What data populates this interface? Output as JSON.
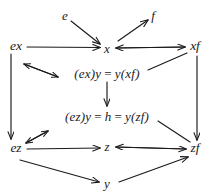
{
  "figure": {
    "kind": "commutative-diagram",
    "stroke_color": "#1a1a1a",
    "background_color": "#ffffff"
  },
  "nodes": [
    {
      "id": "e",
      "label": "e",
      "x": 65,
      "y": 15
    },
    {
      "id": "f",
      "label": "f",
      "x": 153,
      "y": 15
    },
    {
      "id": "ex",
      "label": "ex",
      "x": 16,
      "y": 46
    },
    {
      "id": "x",
      "label": "x",
      "x": 107,
      "y": 48
    },
    {
      "id": "xf",
      "label": "xf",
      "x": 194,
      "y": 46
    },
    {
      "id": "ez",
      "label": "ez",
      "x": 16,
      "y": 148
    },
    {
      "id": "z",
      "label": "z",
      "x": 107,
      "y": 146
    },
    {
      "id": "zf",
      "label": "zf",
      "x": 194,
      "y": 148
    },
    {
      "id": "y",
      "label": "y",
      "x": 107,
      "y": 183
    }
  ],
  "equations": [
    {
      "id": "upper-equation",
      "x": 107,
      "y": 73,
      "lhs": "(ex)y",
      "op1": "=",
      "mid": "y(xf)",
      "op2": "",
      "rhs": ""
    },
    {
      "id": "lower-equation",
      "x": 107,
      "y": 116,
      "lhs": "(ez)y",
      "op1": "=",
      "mid": "h",
      "op2": "=",
      "rhs": "y(zf)"
    }
  ],
  "edges": [
    {
      "id": "e-to-x",
      "from": "e",
      "to": "x",
      "arrow": "single"
    },
    {
      "id": "x-to-f",
      "from": "x",
      "to": "f",
      "arrow": "single"
    },
    {
      "id": "ex-to-x",
      "from": "ex",
      "to": "x",
      "arrow": "single"
    },
    {
      "id": "xf-to-x",
      "from": "xf",
      "to": "x",
      "arrow": "single"
    },
    {
      "id": "x-to-xf",
      "from": "x",
      "to": "xf",
      "arrow": "single"
    },
    {
      "id": "ex-to-ez",
      "from": "ex",
      "to": "ez",
      "arrow": "single"
    },
    {
      "id": "xf-to-zf",
      "from": "xf",
      "to": "zf",
      "arrow": "single"
    },
    {
      "id": "ez-to-z",
      "from": "ez",
      "to": "z",
      "arrow": "single"
    },
    {
      "id": "zf-to-z",
      "from": "zf",
      "to": "z",
      "arrow": "single"
    },
    {
      "id": "z-to-zf",
      "from": "z",
      "to": "zf",
      "arrow": "single"
    },
    {
      "id": "ez-to-y",
      "from": "ez",
      "to": "y",
      "arrow": "single"
    },
    {
      "id": "y-to-zf",
      "from": "y",
      "to": "zf",
      "arrow": "single"
    },
    {
      "id": "ex-upper-eq",
      "from": "ex",
      "to": "upper-equation",
      "arrow": "double"
    },
    {
      "id": "ez-lower-eq",
      "from": "ez",
      "to": "lower-equation",
      "arrow": "double"
    },
    {
      "id": "upper-eq-to-lower-eq",
      "from": "upper-equation",
      "to": "lower-equation",
      "arrow": "single"
    },
    {
      "id": "xf-to-yxf",
      "from": "xf",
      "to": "upper-equation",
      "arrow": "line"
    },
    {
      "id": "yzf-to-zf",
      "from": "lower-equation",
      "to": "zf",
      "arrow": "line"
    }
  ]
}
